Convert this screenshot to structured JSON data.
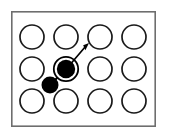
{
  "figure": {
    "canvas": {
      "width": 169,
      "height": 140,
      "background": "#ffffff"
    },
    "frame": {
      "label": "crystal-surface-frame",
      "x": 11,
      "y": 11,
      "width": 145,
      "height": 116,
      "stroke": "#6e6e6e",
      "stroke_width": 1.6,
      "fill": "#ffffff"
    },
    "lattice": {
      "label": "lattice-site-grid",
      "rows": 3,
      "columns": 4,
      "column_centers": [
        32,
        66,
        100,
        134
      ],
      "row_centers": [
        37,
        69,
        101
      ],
      "site_radius": 12,
      "site_stroke": "#1a1a1a",
      "site_stroke_width": 1.7,
      "site_fill": "#ffffff"
    },
    "sites": [
      {
        "name": "site-r1c1",
        "row": 1,
        "col": 1,
        "cx": 32,
        "cy": 37,
        "state": "empty"
      },
      {
        "name": "site-r1c2",
        "row": 1,
        "col": 2,
        "cx": 66,
        "cy": 37,
        "state": "empty"
      },
      {
        "name": "site-r1c3",
        "row": 1,
        "col": 3,
        "cx": 100,
        "cy": 37,
        "state": "empty"
      },
      {
        "name": "site-r1c4",
        "row": 1,
        "col": 4,
        "cx": 134,
        "cy": 37,
        "state": "empty"
      },
      {
        "name": "site-r2c1",
        "row": 2,
        "col": 1,
        "cx": 32,
        "cy": 69,
        "state": "empty"
      },
      {
        "name": "site-r2c2",
        "row": 2,
        "col": 2,
        "cx": 66,
        "cy": 69,
        "state": "occupied-highlighted"
      },
      {
        "name": "site-r2c3",
        "row": 2,
        "col": 3,
        "cx": 100,
        "cy": 69,
        "state": "empty"
      },
      {
        "name": "site-r2c4",
        "row": 2,
        "col": 4,
        "cx": 134,
        "cy": 69,
        "state": "empty"
      },
      {
        "name": "site-r3c1",
        "row": 3,
        "col": 1,
        "cx": 32,
        "cy": 101,
        "state": "empty"
      },
      {
        "name": "site-r3c2",
        "row": 3,
        "col": 2,
        "cx": 66,
        "cy": 101,
        "state": "empty"
      },
      {
        "name": "site-r3c3",
        "row": 3,
        "col": 3,
        "cx": 100,
        "cy": 101,
        "state": "empty"
      },
      {
        "name": "site-r3c4",
        "row": 3,
        "col": 4,
        "cx": 134,
        "cy": 101,
        "state": "empty"
      }
    ],
    "highlighted_particle": {
      "name": "highlighted-particle",
      "cx": 66,
      "cy": 69,
      "core_radius": 9,
      "gap_radius": 11,
      "ring_radius": 13,
      "core_fill": "#000000",
      "gap_fill": "#ffffff",
      "ring_stroke": "#000000",
      "ring_stroke_width": 1.8
    },
    "small_particle": {
      "name": "small-particle",
      "cx": 50,
      "cy": 85,
      "radius": 8.5,
      "fill": "#000000"
    },
    "connector": {
      "name": "particle-connector-line",
      "x1": 50,
      "y1": 85,
      "x2": 66,
      "y2": 69,
      "stroke": "#000000",
      "stroke_width": 2.2
    },
    "motion_arrow": {
      "name": "motion-arrow",
      "x1": 66,
      "y1": 69,
      "x2": 89,
      "y2": 43,
      "stroke": "#000000",
      "stroke_width": 1.6,
      "head_length": 8,
      "head_width": 5,
      "direction": "up-right",
      "angle_degrees": 48
    }
  }
}
